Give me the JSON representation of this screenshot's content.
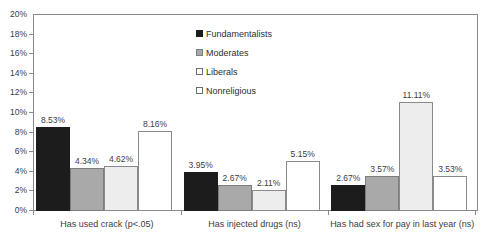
{
  "chart_data": {
    "type": "bar",
    "title": "",
    "subtitle": "",
    "xlabel": "",
    "ylabel": "",
    "ylim": [
      0,
      20
    ],
    "ytick_values": [
      0,
      2,
      4,
      6,
      8,
      10,
      12,
      14,
      16,
      18,
      20
    ],
    "ytick_labels": [
      "0%",
      "2%",
      "4%",
      "6%",
      "8%",
      "10%",
      "12%",
      "14%",
      "16%",
      "18%",
      "20%"
    ],
    "grid": false,
    "legend_position": "top-center",
    "categories": [
      "Has used crack (p<.05)",
      "Has injected drugs (ns)",
      "Has had sex for pay in last year (ns)"
    ],
    "series": [
      {
        "name": "Fundamentalists",
        "color": "#1c1c1c",
        "values": [
          8.53,
          3.95,
          2.67
        ],
        "labels": [
          "8.53%",
          "3.95%",
          "2.67%"
        ]
      },
      {
        "name": "Moderates",
        "color": "#a9a9a9",
        "values": [
          4.34,
          2.67,
          3.57
        ],
        "labels": [
          "4.34%",
          "2.67%",
          "3.57%"
        ]
      },
      {
        "name": "Liberals",
        "color": "#ededed",
        "values": [
          4.62,
          2.11,
          11.11
        ],
        "labels": [
          "4.62%",
          "2.11%",
          "11.11%"
        ]
      },
      {
        "name": "Nonreligious",
        "color": "#ffffff",
        "values": [
          8.16,
          5.15,
          3.53
        ],
        "labels": [
          "8.16%",
          "5.15%",
          "3.53%"
        ]
      }
    ]
  }
}
